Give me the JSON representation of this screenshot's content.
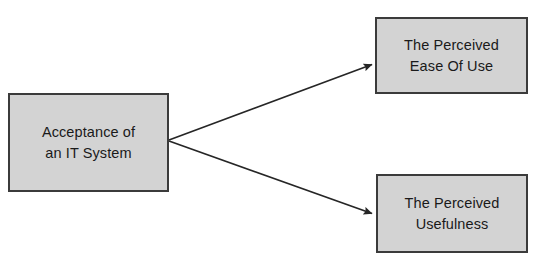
{
  "diagram": {
    "canvas": {
      "width": 540,
      "height": 269,
      "background": "#ffffff"
    },
    "style": {
      "node_fill": "#d3d3d3",
      "node_border": "#3b3b3b",
      "edge_color": "#262626",
      "text_color": "#1a1a1a"
    },
    "nodes": [
      {
        "id": "acceptance",
        "lines": [
          "Acceptance of",
          "an IT System"
        ],
        "line1": "Acceptance of",
        "line2": "an IT System"
      },
      {
        "id": "ease-of-use",
        "lines": [
          "The Perceived",
          "Ease Of Use"
        ],
        "line1": "The Perceived",
        "line2": "Ease Of Use"
      },
      {
        "id": "usefulness",
        "lines": [
          "The Perceived",
          "Usefulness"
        ],
        "line1": "The Perceived",
        "line2": "Usefulness"
      }
    ],
    "edges": [
      {
        "id": "acceptance-to-ease-of-use",
        "from": "acceptance",
        "to": "ease-of-use",
        "arrowhead": "filled-triangle",
        "label": ""
      },
      {
        "id": "acceptance-to-usefulness",
        "from": "acceptance",
        "to": "usefulness",
        "arrowhead": "filled-triangle",
        "label": ""
      }
    ]
  }
}
